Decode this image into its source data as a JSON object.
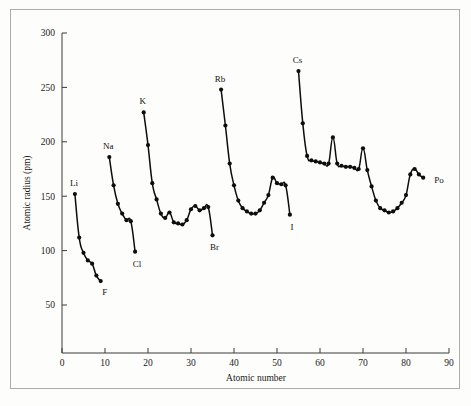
{
  "figure": {
    "background_color": "#fdfdfb",
    "frame_color": "#aeaca6",
    "series_color": "#0d0d0d"
  },
  "chart_data": {
    "type": "line",
    "title": "",
    "xlabel": "Atomic number",
    "ylabel": "Atomic radius (pm)",
    "xlim": [
      0,
      90
    ],
    "ylim": [
      0,
      300
    ],
    "xticks": [
      0,
      10,
      20,
      30,
      40,
      50,
      60,
      70,
      80,
      90
    ],
    "yticks": [
      50,
      100,
      150,
      200,
      250,
      300
    ],
    "xtick_labels": [
      "0",
      "10",
      "20",
      "30",
      "40",
      "50",
      "60",
      "70",
      "80",
      "90"
    ],
    "ytick_labels": [
      "50",
      "100",
      "150",
      "200",
      "250",
      "300"
    ],
    "grid": false,
    "legend": "none",
    "annotations": [
      {
        "text": "Li",
        "x": 3,
        "y": 152
      },
      {
        "text": "F",
        "x": 9,
        "y": 72
      },
      {
        "text": "Na",
        "x": 11,
        "y": 186
      },
      {
        "text": "Cl",
        "x": 17,
        "y": 99
      },
      {
        "text": "K",
        "x": 19,
        "y": 227
      },
      {
        "text": "Br",
        "x": 35,
        "y": 114
      },
      {
        "text": "Rb",
        "x": 37,
        "y": 248
      },
      {
        "text": "I",
        "x": 53,
        "y": 133
      },
      {
        "text": "Cs",
        "x": 55,
        "y": 265
      },
      {
        "text": "Po",
        "x": 84,
        "y": 167
      }
    ],
    "series": [
      {
        "name": "period-2",
        "points": [
          {
            "z": 3,
            "r": 152
          },
          {
            "z": 4,
            "r": 112
          },
          {
            "z": 5,
            "r": 98
          },
          {
            "z": 6,
            "r": 91
          },
          {
            "z": 7,
            "r": 88
          },
          {
            "z": 8,
            "r": 77
          },
          {
            "z": 9,
            "r": 72
          }
        ]
      },
      {
        "name": "period-3",
        "points": [
          {
            "z": 11,
            "r": 186
          },
          {
            "z": 12,
            "r": 160
          },
          {
            "z": 13,
            "r": 143
          },
          {
            "z": 14,
            "r": 134
          },
          {
            "z": 15,
            "r": 128
          },
          {
            "z": 16,
            "r": 127
          },
          {
            "z": 17,
            "r": 99
          }
        ]
      },
      {
        "name": "period-4",
        "points": [
          {
            "z": 19,
            "r": 227
          },
          {
            "z": 20,
            "r": 197
          },
          {
            "z": 21,
            "r": 162
          },
          {
            "z": 22,
            "r": 147
          },
          {
            "z": 23,
            "r": 134
          },
          {
            "z": 24,
            "r": 130
          },
          {
            "z": 25,
            "r": 135
          },
          {
            "z": 26,
            "r": 126
          },
          {
            "z": 27,
            "r": 125
          },
          {
            "z": 28,
            "r": 124
          },
          {
            "z": 29,
            "r": 128
          },
          {
            "z": 30,
            "r": 138
          },
          {
            "z": 31,
            "r": 141
          },
          {
            "z": 32,
            "r": 137
          },
          {
            "z": 33,
            "r": 139
          },
          {
            "z": 34,
            "r": 140
          },
          {
            "z": 35,
            "r": 114
          }
        ]
      },
      {
        "name": "period-5",
        "points": [
          {
            "z": 37,
            "r": 248
          },
          {
            "z": 38,
            "r": 215
          },
          {
            "z": 39,
            "r": 180
          },
          {
            "z": 40,
            "r": 160
          },
          {
            "z": 41,
            "r": 146
          },
          {
            "z": 42,
            "r": 139
          },
          {
            "z": 43,
            "r": 136
          },
          {
            "z": 44,
            "r": 134
          },
          {
            "z": 45,
            "r": 134
          },
          {
            "z": 46,
            "r": 137
          },
          {
            "z": 47,
            "r": 144
          },
          {
            "z": 48,
            "r": 151
          },
          {
            "z": 49,
            "r": 167
          },
          {
            "z": 50,
            "r": 162
          },
          {
            "z": 51,
            "r": 161
          },
          {
            "z": 52,
            "r": 160
          },
          {
            "z": 53,
            "r": 133
          }
        ]
      },
      {
        "name": "period-6",
        "points": [
          {
            "z": 55,
            "r": 265
          },
          {
            "z": 56,
            "r": 217
          },
          {
            "z": 57,
            "r": 187
          },
          {
            "z": 58,
            "r": 183
          },
          {
            "z": 59,
            "r": 182
          },
          {
            "z": 60,
            "r": 181
          },
          {
            "z": 61,
            "r": 180
          },
          {
            "z": 62,
            "r": 180
          },
          {
            "z": 63,
            "r": 204
          },
          {
            "z": 64,
            "r": 180
          },
          {
            "z": 65,
            "r": 178
          },
          {
            "z": 66,
            "r": 177
          },
          {
            "z": 67,
            "r": 177
          },
          {
            "z": 68,
            "r": 176
          },
          {
            "z": 69,
            "r": 175
          },
          {
            "z": 70,
            "r": 194
          },
          {
            "z": 71,
            "r": 174
          },
          {
            "z": 72,
            "r": 159
          },
          {
            "z": 73,
            "r": 146
          },
          {
            "z": 74,
            "r": 139
          },
          {
            "z": 75,
            "r": 137
          },
          {
            "z": 76,
            "r": 135
          },
          {
            "z": 77,
            "r": 136
          },
          {
            "z": 78,
            "r": 139
          },
          {
            "z": 79,
            "r": 144
          },
          {
            "z": 80,
            "r": 151
          },
          {
            "z": 81,
            "r": 170
          },
          {
            "z": 82,
            "r": 175
          },
          {
            "z": 83,
            "r": 170
          },
          {
            "z": 84,
            "r": 167
          }
        ]
      }
    ]
  }
}
